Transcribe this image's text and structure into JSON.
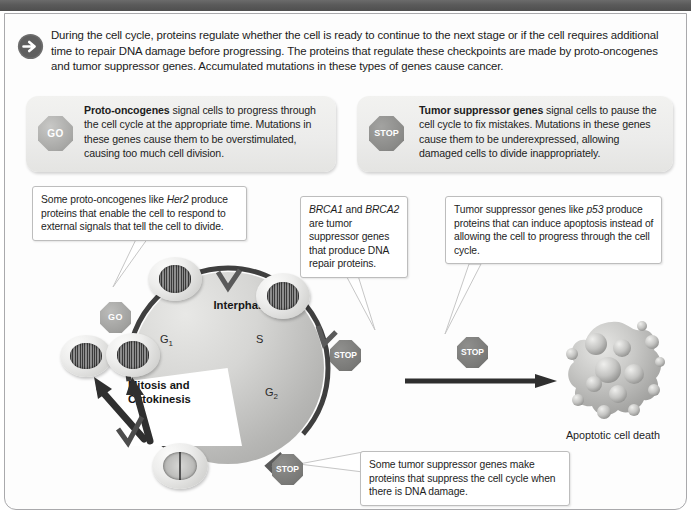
{
  "intro": {
    "icon": "arrow-right-circle-icon",
    "text": "During the cell cycle, proteins regulate whether the cell is ready to continue to the next stage or if the cell requires additional time to repair DNA damage before progressing.  The proteins that regulate these checkpoints are made by proto-oncogenes and tumor suppressor genes. Accumulated mutations in these types of genes cause cancer."
  },
  "definitions": {
    "left": {
      "sign_label": "GO",
      "sign_icon": "go-octagon-sign-icon",
      "term": "Proto-oncogenes",
      "body": " signal cells to progress through the cell cycle at the appropriate time. Mutations in these genes cause them to be overstimulated, causing too much cell division."
    },
    "right": {
      "sign_label": "STOP",
      "sign_icon": "stop-octagon-sign-icon",
      "term": "Tumor suppressor genes",
      "body": " signal cells to pause the cell cycle to fix mistakes. Mutations in these genes cause them to be underexpressed, allowing damaged cells to divide inappropriately."
    }
  },
  "callouts": {
    "her2": {
      "pre": "Some proto-oncogenes like ",
      "gene": "Her2",
      "post": " produce proteins that enable the cell to respond to external signals that tell the cell to divide."
    },
    "brca": {
      "gene1": "BRCA1",
      "mid": " and ",
      "gene2": "BRCA2",
      "post": " are tumor suppressor genes that produce DNA repair proteins."
    },
    "p53": {
      "pre": "Tumor suppressor genes like ",
      "gene": "p53",
      "post": " produce proteins that can induce apoptosis instead of allowing the cell to progress through the cell cycle."
    },
    "bottom": {
      "text": "Some tumor suppressor genes make proteins that suppress the cell cycle when there is DNA damage."
    }
  },
  "cycle": {
    "interphase_label": "Interphase",
    "g1_label": "G",
    "g1_sub": "1",
    "s_label": "S",
    "g2_label": "G",
    "g2_sub": "2",
    "mitosis_label": "Mitosis and Cytokinesis",
    "checkpoint_go": "GO",
    "checkpoint_stop_1": "STOP",
    "checkpoint_stop_2": "STOP",
    "cell_icons": [
      "cell-g1-icon",
      "cell-s-icon",
      "cell-mitosis-spindle-icon",
      "daughter-cell-1-icon",
      "daughter-cell-2-icon"
    ]
  },
  "apoptosis": {
    "stop_label": "STOP",
    "arrow_icon": "arrow-right-icon",
    "blob_icon": "apoptotic-cell-icon",
    "label": "Apoptotic cell death"
  },
  "colors": {
    "topbar": "#5a5a5a",
    "frame_border": "#a9a9ac",
    "text": "#1d1d1d",
    "wheel_ring": "#4a4a4a",
    "sign_go": "#a8a8a6",
    "sign_stop": "#797977"
  }
}
